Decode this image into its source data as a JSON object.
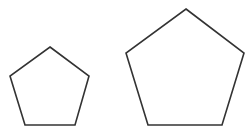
{
  "diagram": {
    "background": "#ffffff",
    "shapes": [
      {
        "id": "small-pentagon",
        "type": "regular-pentagon",
        "points": "50,47 89,76 75,125 25,125 10,76",
        "stroke": "#333333",
        "stroke_width": "1.6"
      },
      {
        "id": "large-pentagon",
        "type": "regular-pentagon",
        "points": "186,9 244,53 222,125 148,125 126,53",
        "stroke": "#333333",
        "stroke_width": "1.6"
      }
    ]
  }
}
